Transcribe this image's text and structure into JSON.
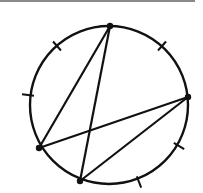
{
  "diagram": {
    "type": "circle-with-chords",
    "stroke_color": "#111111",
    "rule_color": "#8a8a8a",
    "circle": {
      "cx": 109,
      "cy": 105,
      "r": 79
    },
    "points": [
      {
        "id": "A",
        "x": 110,
        "y": 26
      },
      {
        "id": "B",
        "x": 188,
        "y": 97
      },
      {
        "id": "C",
        "x": 39,
        "y": 148
      },
      {
        "id": "D",
        "x": 80,
        "y": 181
      }
    ],
    "chords": [
      {
        "from": "A",
        "to": "C"
      },
      {
        "from": "A",
        "to": "D"
      },
      {
        "from": "C",
        "to": "B"
      },
      {
        "from": "D",
        "to": "B"
      }
    ],
    "ticks": [
      {
        "x": 57,
        "y": 46
      },
      {
        "x": 162,
        "y": 46
      },
      {
        "x": 28,
        "y": 95
      },
      {
        "x": 179,
        "y": 146
      },
      {
        "x": 139,
        "y": 182
      }
    ]
  }
}
